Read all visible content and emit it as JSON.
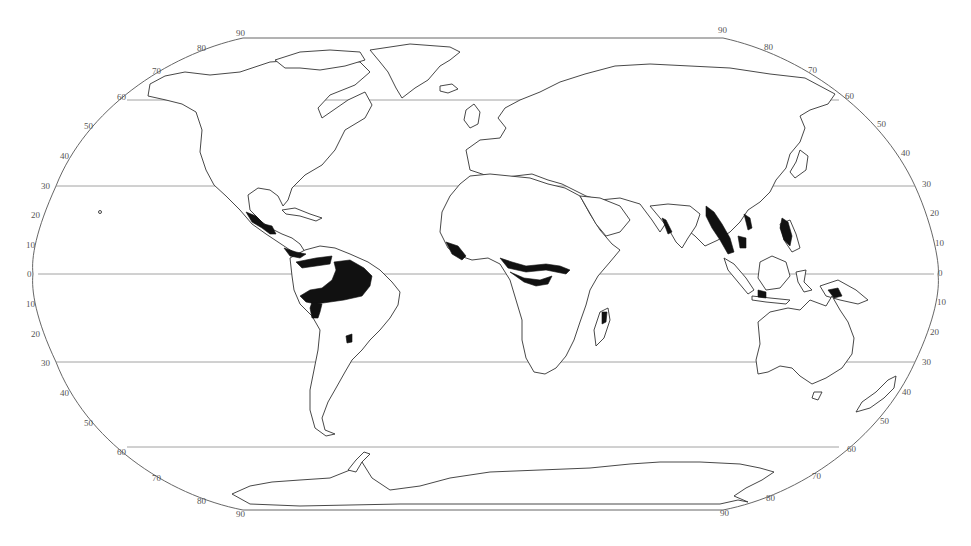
{
  "map": {
    "projection": "Robinson",
    "subject": "Tropical rainforest distribution",
    "colors": {
      "background": "#ffffff",
      "outline": "#333333",
      "grid": "#8a8a8a",
      "rainforest": "#111111"
    },
    "gridlines": [
      {
        "lat": 60,
        "y": 100
      },
      {
        "lat": 30,
        "y": 186
      },
      {
        "lat": 0,
        "y": 274
      },
      {
        "lat": -30,
        "y": 362
      },
      {
        "lat": -60,
        "y": 447
      }
    ],
    "left_labels": [
      {
        "text": "90",
        "x": 236,
        "y": 36
      },
      {
        "text": "80",
        "x": 197,
        "y": 51
      },
      {
        "text": "70",
        "x": 152,
        "y": 74
      },
      {
        "text": "60",
        "x": 117,
        "y": 100
      },
      {
        "text": "50",
        "x": 84,
        "y": 129
      },
      {
        "text": "40",
        "x": 60,
        "y": 159
      },
      {
        "text": "30",
        "x": 41,
        "y": 189
      },
      {
        "text": "20",
        "x": 31,
        "y": 218
      },
      {
        "text": "10",
        "x": 26,
        "y": 248
      },
      {
        "text": "0",
        "x": 27,
        "y": 277
      },
      {
        "text": "10",
        "x": 26,
        "y": 307
      },
      {
        "text": "20",
        "x": 31,
        "y": 337
      },
      {
        "text": "30",
        "x": 41,
        "y": 366
      },
      {
        "text": "40",
        "x": 60,
        "y": 396
      },
      {
        "text": "50",
        "x": 84,
        "y": 426
      },
      {
        "text": "60",
        "x": 117,
        "y": 455
      },
      {
        "text": "70",
        "x": 152,
        "y": 481
      },
      {
        "text": "80",
        "x": 197,
        "y": 504
      },
      {
        "text": "90",
        "x": 236,
        "y": 517
      }
    ],
    "right_labels": [
      {
        "text": "90",
        "x": 718,
        "y": 33
      },
      {
        "text": "80",
        "x": 764,
        "y": 50
      },
      {
        "text": "70",
        "x": 808,
        "y": 73
      },
      {
        "text": "60",
        "x": 845,
        "y": 99
      },
      {
        "text": "50",
        "x": 877,
        "y": 127
      },
      {
        "text": "40",
        "x": 901,
        "y": 156
      },
      {
        "text": "30",
        "x": 922,
        "y": 187
      },
      {
        "text": "20",
        "x": 930,
        "y": 216
      },
      {
        "text": "10",
        "x": 935,
        "y": 246
      },
      {
        "text": "0",
        "x": 938,
        "y": 276
      },
      {
        "text": "10",
        "x": 937,
        "y": 305
      },
      {
        "text": "20",
        "x": 930,
        "y": 335
      },
      {
        "text": "30",
        "x": 922,
        "y": 365
      },
      {
        "text": "40",
        "x": 902,
        "y": 395
      },
      {
        "text": "50",
        "x": 880,
        "y": 424
      },
      {
        "text": "60",
        "x": 847,
        "y": 452
      },
      {
        "text": "70",
        "x": 812,
        "y": 479
      },
      {
        "text": "80",
        "x": 766,
        "y": 501
      },
      {
        "text": "90",
        "x": 720,
        "y": 516
      }
    ],
    "rainforest_regions": [
      "Central America",
      "Amazon Basin",
      "West Africa",
      "Congo Basin",
      "Madagascar",
      "Western Ghats",
      "Southeast Asia",
      "Philippines",
      "Indonesia",
      "New Guinea",
      "Atlantic Forest"
    ]
  }
}
